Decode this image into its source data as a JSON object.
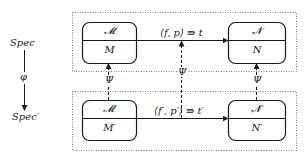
{
  "left_axis": {
    "top_label": "Spec",
    "bottom_label": "Spec′",
    "arrow_label": "φ"
  },
  "top_row": {
    "left_box": {
      "upper": "𝓜",
      "lower": "M"
    },
    "right_box": {
      "upper": "𝓝",
      "lower": "N"
    },
    "arrow_label": "⟨f, p⟩ ⇛ t"
  },
  "bottom_row": {
    "left_box": {
      "upper": "𝓜′",
      "lower": "M′"
    },
    "right_box": {
      "upper": "𝓝′",
      "lower": "N′"
    },
    "arrow_label": "⟨f′, p′⟩ ⇛ t′"
  },
  "vertical_maps": {
    "left": "Ψ",
    "middle": "Ψ",
    "right": "Ψ"
  },
  "colors": {
    "stroke": "#1a1a1a",
    "dotted": "#555555",
    "background": "#ffffff"
  }
}
